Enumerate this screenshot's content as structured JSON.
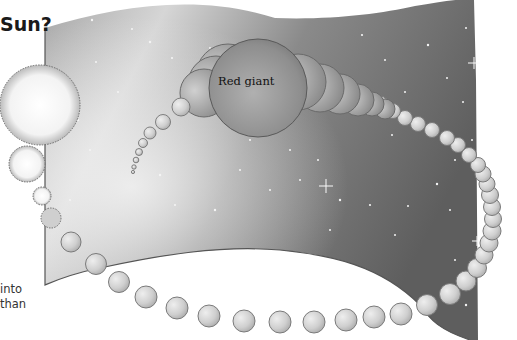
{
  "heading": {
    "text": "Sun?"
  },
  "caption": {
    "lines": [
      "into",
      "than"
    ]
  },
  "labels": {
    "red_giant": "Red giant"
  },
  "colors": {
    "page_bg": "#ffffff",
    "space_dark": "#6e6e6e",
    "space_light": "#d8d8d8",
    "star_shade": "#bdbdbd",
    "text": "#1a1a1a"
  }
}
